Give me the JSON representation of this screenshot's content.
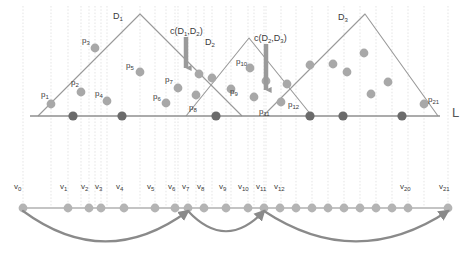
{
  "figure": {
    "width": 475,
    "height": 255,
    "colors": {
      "background": "#ffffff",
      "gridline": "#d8d8d8",
      "baseline": "#8f8f8f",
      "wedge_stroke": "#9a9a9a",
      "point_light": "#a8a8a8",
      "point_dark": "#6b6b6b",
      "vertex": "#b4b4b4",
      "arc": "#8a8a8a",
      "arrow_marker": "#9a9a9a",
      "text": "#3a3a3a"
    }
  },
  "axis": {
    "line_label": "L",
    "line_label_x": 452,
    "line_label_y": 106,
    "baseline_y": 116,
    "baseline_x1": 30,
    "baseline_x2": 440
  },
  "wedges": [
    {
      "name": "D1",
      "label": "D",
      "sub": "1",
      "apex_x": 140,
      "apex_y": 14,
      "left_x": 38,
      "right_x": 242,
      "label_x": 113,
      "label_y": 12
    },
    {
      "name": "D2",
      "label": "D",
      "sub": "2",
      "apex_x": 249,
      "apex_y": 38,
      "left_x": 186,
      "right_x": 312,
      "label_x": 205,
      "label_y": 38
    },
    {
      "name": "D3",
      "label": "D",
      "sub": "3",
      "apex_x": 365,
      "apex_y": 14,
      "left_x": 263,
      "right_x": 438,
      "label_x": 338,
      "label_y": 13
    }
  ],
  "arrow_annotations": [
    {
      "name": "c-D1-D2",
      "text": "c(D",
      "sub1": "1",
      "mid": ",D",
      "sub2": "2",
      "tail": ")",
      "label_x": 170,
      "label_y": 27,
      "arrow_x": 186,
      "arrow_y0": 37,
      "arrow_y1": 75
    },
    {
      "name": "c-D2-D3",
      "text": "c(D",
      "sub1": "2",
      "mid": ",D",
      "sub2": "3",
      "tail": ")",
      "label_x": 254,
      "label_y": 34,
      "arrow_x": 266,
      "arrow_y0": 44,
      "arrow_y1": 97
    }
  ],
  "labeled_points": [
    {
      "id": "p1",
      "label": "p",
      "sub": "1",
      "x": 51,
      "y": 104,
      "label_x": 41,
      "label_y": 91
    },
    {
      "id": "p2",
      "label": "p",
      "sub": "2",
      "x": 81,
      "y": 92,
      "label_x": 71,
      "label_y": 79
    },
    {
      "id": "p3",
      "label": "p",
      "sub": "3",
      "x": 95,
      "y": 48,
      "label_x": 82,
      "label_y": 37
    },
    {
      "id": "p4",
      "label": "p",
      "sub": "4",
      "x": 107,
      "y": 101,
      "label_x": 95,
      "label_y": 90
    },
    {
      "id": "p5",
      "label": "p",
      "sub": "5",
      "x": 140,
      "y": 72,
      "label_x": 126,
      "label_y": 62
    },
    {
      "id": "p6",
      "label": "p",
      "sub": "6",
      "x": 166,
      "y": 103,
      "label_x": 153,
      "label_y": 93
    },
    {
      "id": "p7",
      "label": "p",
      "sub": "7",
      "x": 178,
      "y": 88,
      "label_x": 165,
      "label_y": 76
    },
    {
      "id": "p8",
      "label": "p",
      "sub": "8",
      "x": 196,
      "y": 95,
      "label_x": 189,
      "label_y": 104
    },
    {
      "id": "p9",
      "label": "p",
      "sub": "9",
      "x": 212,
      "y": 78,
      "label_x": 230,
      "label_y": 88
    },
    {
      "id": "p10",
      "label": "p",
      "sub": "10",
      "x": 250,
      "y": 68,
      "label_x": 236,
      "label_y": 58
    },
    {
      "id": "p11",
      "label": "p",
      "sub": "11",
      "x": 254,
      "y": 97,
      "label_x": 259,
      "label_y": 108
    },
    {
      "id": "p12",
      "label": "p",
      "sub": "12",
      "x": 281,
      "y": 102,
      "label_x": 288,
      "label_y": 101
    },
    {
      "id": "p21",
      "label": "p",
      "sub": "21",
      "x": 424,
      "y": 104,
      "label_x": 428,
      "label_y": 96
    }
  ],
  "unlabeled_points": [
    {
      "x": 199,
      "y": 74
    },
    {
      "x": 231,
      "y": 89
    },
    {
      "x": 266,
      "y": 81
    },
    {
      "x": 287,
      "y": 84
    },
    {
      "x": 310,
      "y": 65
    },
    {
      "x": 333,
      "y": 64
    },
    {
      "x": 347,
      "y": 72
    },
    {
      "x": 364,
      "y": 53
    },
    {
      "x": 388,
      "y": 82
    },
    {
      "x": 371,
      "y": 94
    }
  ],
  "baseline_points": [
    {
      "x": 73
    },
    {
      "x": 122
    },
    {
      "x": 216
    },
    {
      "x": 310
    },
    {
      "x": 343
    },
    {
      "x": 402
    }
  ],
  "gridlines_x": [
    23,
    51,
    68,
    81,
    89,
    95,
    101,
    107,
    122,
    140,
    155,
    166,
    175,
    178,
    188,
    196,
    204,
    212,
    226,
    231,
    248,
    254,
    264,
    266,
    281,
    296,
    312,
    328,
    344,
    360,
    376,
    392,
    408,
    424,
    448
  ],
  "lower_axis": {
    "y": 208,
    "x1": 23,
    "x2": 448,
    "vertices": [
      {
        "id": "v0",
        "label": "v",
        "sub": "0",
        "x": 23,
        "label_x": 14,
        "label_y": 183
      },
      {
        "id": "v1",
        "label": "v",
        "sub": "1",
        "x": 68,
        "label_x": 60,
        "label_y": 183
      },
      {
        "id": "v2",
        "label": "v",
        "sub": "2",
        "x": 89,
        "label_x": 81,
        "label_y": 183
      },
      {
        "id": "v3",
        "label": "v",
        "sub": "3",
        "x": 101,
        "label_x": 95,
        "label_y": 183
      },
      {
        "id": "v4",
        "label": "v",
        "sub": "4",
        "x": 124,
        "label_x": 116,
        "label_y": 183
      },
      {
        "id": "v5",
        "label": "v",
        "sub": "5",
        "x": 155,
        "label_x": 147,
        "label_y": 183
      },
      {
        "id": "v6",
        "label": "v",
        "sub": "6",
        "x": 175,
        "label_x": 168,
        "label_y": 183
      },
      {
        "id": "v7",
        "label": "v",
        "sub": "7",
        "x": 188,
        "label_x": 182,
        "label_y": 183
      },
      {
        "id": "v8",
        "label": "v",
        "sub": "8",
        "x": 204,
        "label_x": 197,
        "label_y": 183
      },
      {
        "id": "v9",
        "label": "v",
        "sub": "9",
        "x": 226,
        "label_x": 219,
        "label_y": 183
      },
      {
        "id": "v10",
        "label": "v",
        "sub": "10",
        "x": 248,
        "label_x": 238,
        "label_y": 183
      },
      {
        "id": "v11",
        "label": "v",
        "sub": "11",
        "x": 264,
        "label_x": 256,
        "label_y": 183
      },
      {
        "id": "v12",
        "label": "v",
        "sub": "12",
        "x": 280,
        "label_x": 274,
        "label_y": 183
      },
      {
        "id": "v13",
        "label": "",
        "sub": "",
        "x": 296,
        "label_x": 0,
        "label_y": 0
      },
      {
        "id": "v14",
        "label": "",
        "sub": "",
        "x": 312,
        "label_x": 0,
        "label_y": 0
      },
      {
        "id": "v15",
        "label": "",
        "sub": "",
        "x": 328,
        "label_x": 0,
        "label_y": 0
      },
      {
        "id": "v16",
        "label": "",
        "sub": "",
        "x": 344,
        "label_x": 0,
        "label_y": 0
      },
      {
        "id": "v17",
        "label": "",
        "sub": "",
        "x": 360,
        "label_x": 0,
        "label_y": 0
      },
      {
        "id": "v18",
        "label": "",
        "sub": "",
        "x": 376,
        "label_x": 0,
        "label_y": 0
      },
      {
        "id": "v19",
        "label": "",
        "sub": "",
        "x": 392,
        "label_x": 0,
        "label_y": 0
      },
      {
        "id": "v20",
        "label": "v",
        "sub": "20",
        "x": 408,
        "label_x": 400,
        "label_y": 183
      },
      {
        "id": "v21",
        "label": "v",
        "sub": "21",
        "x": 448,
        "label_x": 439,
        "label_y": 183
      }
    ],
    "arcs": [
      {
        "name": "arc-v0-v7",
        "from": "v0",
        "to": "v7",
        "x1": 23,
        "x2": 188,
        "depth": 44
      },
      {
        "name": "arc-v7-v11",
        "from": "v7",
        "to": "v11",
        "x1": 188,
        "x2": 264,
        "depth": 30
      },
      {
        "name": "arc-v11-v21",
        "from": "v11",
        "to": "v21",
        "x1": 264,
        "x2": 448,
        "depth": 44
      }
    ]
  }
}
